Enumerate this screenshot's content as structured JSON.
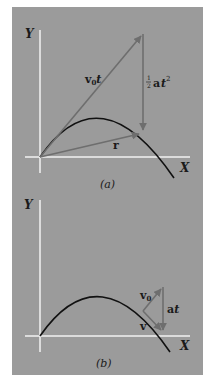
{
  "figure": {
    "background": "#9b9b9b",
    "axis_color": "#f2f2f2",
    "curve_color": "#111111",
    "vector_color": "#6e6e6e",
    "panels": [
      {
        "id": "a",
        "caption": "(a)",
        "axis_y_label": "Y",
        "axis_x_label": "X",
        "vectors": [
          {
            "name": "v0t",
            "label_main": "v",
            "label_sub": "0",
            "label_suffix": "t"
          },
          {
            "name": "half-at2",
            "label_frac_num": "1",
            "label_frac_den": "2",
            "label_main": "a",
            "label_suffix": "t",
            "label_sup": "2"
          },
          {
            "name": "r",
            "label_main": "r"
          }
        ]
      },
      {
        "id": "b",
        "caption": "(b)",
        "axis_y_label": "Y",
        "axis_x_label": "X",
        "vectors": [
          {
            "name": "v0",
            "label_main": "v",
            "label_sub": "0"
          },
          {
            "name": "at",
            "label_main": "a",
            "label_suffix": "t"
          },
          {
            "name": "v",
            "label_main": "v"
          }
        ]
      }
    ]
  }
}
